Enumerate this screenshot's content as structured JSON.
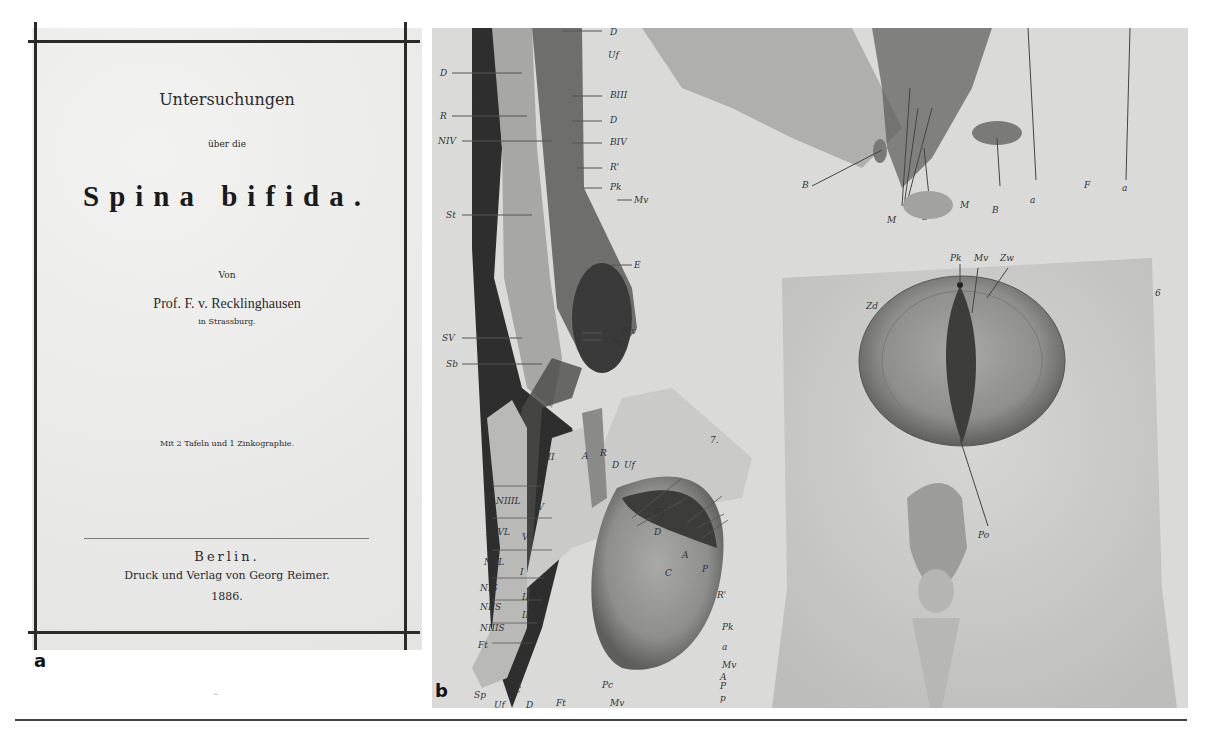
{
  "figure": {
    "panels": [
      {
        "label": "a",
        "type": "book-title-page",
        "title_line1": "Untersuchungen",
        "title_line2": "über die",
        "main_title": "Spina bifida.",
        "by": "Von",
        "author": "Prof. F. v. Recklinghausen",
        "author_location": "in Strassburg.",
        "plates_note": "Mit 2 Tafeln und 1 Zinkographie.",
        "city": "Berlin.",
        "publisher": "Druck und Verlag von Georg Reimer.",
        "year": "1886."
      },
      {
        "label": "b",
        "type": "anatomical-plate",
        "figure_numbers": [
          "7.",
          "6"
        ],
        "upper_left_section_labels": [
          "D",
          "Uf",
          "D",
          "BIII",
          "R",
          "D",
          "NIV",
          "BIV",
          "R'",
          "Pk",
          "Mv",
          "St",
          "E",
          "SV",
          "Mv",
          "Pc",
          "Sb",
          "S"
        ],
        "fig7_labels": [
          "III",
          "A",
          "R",
          "D",
          "Uf",
          "NIIIL",
          "IV",
          "NIVL",
          "V",
          "BV",
          "D",
          "NVL",
          "I",
          "A",
          "C",
          "P",
          "NIS",
          "II",
          "NIIS",
          "III",
          "R'",
          "NIIIS",
          "Ft",
          "IV",
          "V",
          "Pk",
          "a",
          "Mv",
          "A",
          "P",
          "p",
          "Sp",
          "C",
          "Uf",
          "D",
          "Ft",
          "Pc",
          "Mv"
        ],
        "upper_right_labels": [
          "B",
          "M",
          "S",
          "M",
          "B",
          "a",
          "F",
          "a"
        ],
        "fig6_labels": [
          "Pk",
          "Mv",
          "Zw",
          "Zd",
          "Po"
        ]
      }
    ]
  }
}
